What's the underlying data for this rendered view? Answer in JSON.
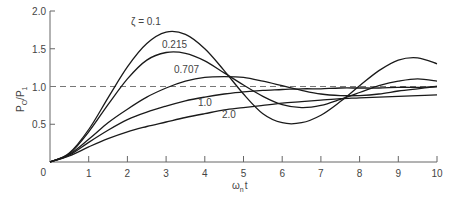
{
  "chart_data": {
    "type": "line",
    "title": "",
    "xlabel": "ωₙt",
    "ylabel": "P₀/P₁",
    "xlim": [
      0,
      10
    ],
    "ylim": [
      0,
      2.0
    ],
    "grid": false,
    "x_ticks": [
      "0",
      "1",
      "2",
      "3",
      "4",
      "5",
      "6",
      "7",
      "8",
      "9",
      "10"
    ],
    "y_ticks": [
      "0",
      "0.5",
      "1.0",
      "1.5",
      "2.0"
    ],
    "reference_line": {
      "y": 1.0,
      "style": "dashed"
    },
    "x": [
      0,
      0.5,
      1,
      1.5,
      2,
      2.5,
      3,
      3.5,
      4,
      4.5,
      5,
      5.5,
      6,
      6.5,
      7,
      7.5,
      8,
      8.5,
      9,
      9.5,
      10
    ],
    "series": [
      {
        "name": "ζ = 0.1",
        "label": "ζ = 0.1",
        "values": [
          0,
          0.12,
          0.43,
          0.85,
          1.26,
          1.57,
          1.72,
          1.69,
          1.5,
          1.21,
          0.9,
          0.64,
          0.52,
          0.52,
          0.62,
          0.8,
          1.01,
          1.21,
          1.35,
          1.38,
          1.3
        ]
      },
      {
        "name": "ζ = 0.215",
        "label": "0.215",
        "values": [
          0,
          0.11,
          0.4,
          0.76,
          1.1,
          1.35,
          1.45,
          1.44,
          1.34,
          1.18,
          1.02,
          0.87,
          0.76,
          0.72,
          0.75,
          0.83,
          0.92,
          1.01,
          1.07,
          1.1,
          1.07
        ]
      },
      {
        "name": "ζ = 0.707",
        "label": "0.707",
        "values": [
          0,
          0.1,
          0.3,
          0.52,
          0.7,
          0.86,
          0.98,
          1.07,
          1.12,
          1.13,
          1.12,
          1.07,
          1.01,
          0.95,
          0.9,
          0.88,
          0.88,
          0.9,
          0.94,
          0.97,
          1.0
        ]
      },
      {
        "name": "ζ = 1.0",
        "label": "1.0",
        "values": [
          0,
          0.09,
          0.26,
          0.42,
          0.56,
          0.66,
          0.74,
          0.81,
          0.86,
          0.9,
          0.93,
          0.95,
          0.96,
          0.97,
          0.97,
          0.98,
          0.98,
          0.98,
          0.99,
          0.99,
          1.0
        ]
      },
      {
        "name": "ζ = 2.0",
        "label": "2.0",
        "values": [
          0,
          0.08,
          0.2,
          0.31,
          0.4,
          0.47,
          0.53,
          0.59,
          0.64,
          0.69,
          0.72,
          0.75,
          0.78,
          0.8,
          0.82,
          0.84,
          0.85,
          0.86,
          0.87,
          0.88,
          0.89
        ]
      }
    ],
    "legend": "inline curve labels"
  },
  "labels": {
    "zeta_01": "ζ = 0.1",
    "zeta_0215": "0.215",
    "zeta_0707": "0.707",
    "zeta_10": "1.0",
    "zeta_20": "2.0",
    "xlabel_main": "ω",
    "xlabel_sub": "n",
    "xlabel_t": "t",
    "ylabel_main": "P",
    "ylabel_sub0": "O",
    "ylabel_mid": "/P",
    "ylabel_sub1": "1"
  }
}
